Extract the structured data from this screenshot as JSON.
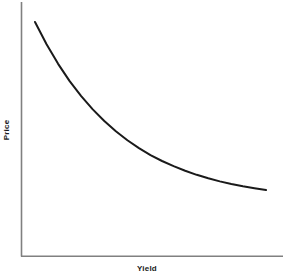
{
  "chart_data": {
    "type": "line",
    "title": "",
    "subtitle": "",
    "xlabel": "Yield",
    "ylabel": "Price",
    "legend": [],
    "annotations": [],
    "grid": false,
    "ticks": {
      "x": [],
      "y": []
    },
    "axis_style": {
      "spines": [
        "left",
        "bottom"
      ],
      "color": "#808080",
      "width_px": 1.4,
      "arrowheads": false
    },
    "series": [
      {
        "name": "price-yield-curve",
        "color": "#1a1a1a",
        "width_px": 2,
        "shape": "convex-decreasing",
        "description": "Inverse convex relationship: bond price falls as yield rises, at a decreasing rate (positive convexity).",
        "x": [
          0.0,
          0.05,
          0.1,
          0.15,
          0.2,
          0.25,
          0.3,
          0.35,
          0.4,
          0.45,
          0.5,
          0.55,
          0.6,
          0.65,
          0.7,
          0.75,
          0.8,
          0.85,
          0.9,
          0.95,
          1.0
        ],
        "y": [
          1.0,
          0.884,
          0.782,
          0.692,
          0.614,
          0.545,
          0.484,
          0.431,
          0.384,
          0.343,
          0.307,
          0.276,
          0.249,
          0.225,
          0.204,
          0.186,
          0.17,
          0.156,
          0.144,
          0.134,
          0.125
        ]
      }
    ],
    "xlim": [
      0,
      1
    ],
    "ylim": [
      0,
      1
    ],
    "pixel_geometry": {
      "y_axis_x": 21,
      "y_axis_top": 2,
      "axis_baseline_y": 256,
      "x_axis_right": 283,
      "curve_start": [
        35,
        22
      ],
      "curve_end": [
        266,
        190
      ]
    }
  },
  "colors": {
    "background": "#ffffff",
    "axis": "#808080",
    "curve": "#1a1a1a",
    "label_text": "#1a1a1a"
  }
}
